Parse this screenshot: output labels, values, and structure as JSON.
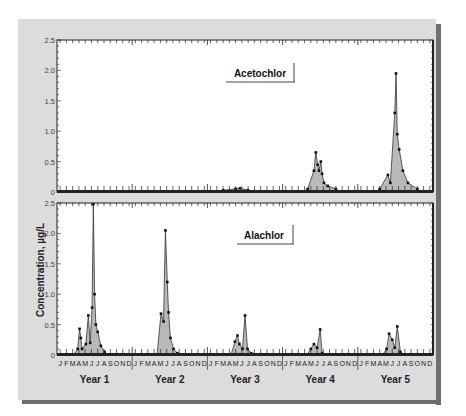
{
  "chart_data": [
    {
      "type": "area",
      "title": "Acetochlor",
      "xlabel": "",
      "ylabel": "Concentration, µg/L",
      "ylim": [
        0,
        2.5
      ],
      "yticks": [
        "0",
        "0.5",
        "1.0",
        "1.5",
        "2.0",
        "2.5"
      ],
      "x_categories": [
        "Year 1",
        "Year 2",
        "Year 3",
        "Year 4",
        "Year 5"
      ],
      "months": [
        "J",
        "F",
        "M",
        "A",
        "M",
        "J",
        "J",
        "A",
        "S",
        "O",
        "N",
        "D"
      ],
      "grid": false,
      "legend_position": "upper-center-right",
      "series": [
        {
          "name": "Acetochlor",
          "points": [
            {
              "year": 3,
              "month": 2.5,
              "value": 0.03
            },
            {
              "year": 3,
              "month": 4.5,
              "value": 0.05
            },
            {
              "year": 3,
              "month": 5.2,
              "value": 0.06
            },
            {
              "year": 3,
              "month": 6.5,
              "value": 0.03
            },
            {
              "year": 4,
              "month": 4.0,
              "value": 0.05
            },
            {
              "year": 4,
              "month": 5.0,
              "value": 0.35
            },
            {
              "year": 4,
              "month": 5.3,
              "value": 0.65
            },
            {
              "year": 4,
              "month": 5.6,
              "value": 0.45
            },
            {
              "year": 4,
              "month": 5.8,
              "value": 0.35
            },
            {
              "year": 4,
              "month": 6.1,
              "value": 0.5
            },
            {
              "year": 4,
              "month": 6.3,
              "value": 0.3
            },
            {
              "year": 4,
              "month": 6.6,
              "value": 0.15
            },
            {
              "year": 4,
              "month": 7.2,
              "value": 0.1
            },
            {
              "year": 4,
              "month": 8.5,
              "value": 0.05
            },
            {
              "year": 5,
              "month": 3.5,
              "value": 0.05
            },
            {
              "year": 5,
              "month": 4.8,
              "value": 0.28
            },
            {
              "year": 5,
              "month": 5.2,
              "value": 0.15
            },
            {
              "year": 5,
              "month": 5.9,
              "value": 1.3
            },
            {
              "year": 5,
              "month": 6.1,
              "value": 1.95
            },
            {
              "year": 5,
              "month": 6.3,
              "value": 0.95
            },
            {
              "year": 5,
              "month": 6.6,
              "value": 0.7
            },
            {
              "year": 5,
              "month": 7.2,
              "value": 0.35
            },
            {
              "year": 5,
              "month": 8.0,
              "value": 0.15
            },
            {
              "year": 5,
              "month": 9.5,
              "value": 0.05
            }
          ]
        }
      ]
    },
    {
      "type": "area",
      "title": "Alachlor",
      "xlabel": "",
      "ylabel": "Concentration, µg/L",
      "ylim": [
        0,
        2.5
      ],
      "yticks": [
        "0",
        "0.5",
        "1.0",
        "1.5",
        "2.0",
        "2.5"
      ],
      "x_categories": [
        "Year 1",
        "Year 2",
        "Year 3",
        "Year 4",
        "Year 5"
      ],
      "months": [
        "J",
        "F",
        "M",
        "A",
        "M",
        "J",
        "J",
        "A",
        "S",
        "O",
        "N",
        "D"
      ],
      "grid": false,
      "legend_position": "upper-center-right",
      "series": [
        {
          "name": "Alachlor",
          "points": [
            {
              "year": 1,
              "month": 3.3,
              "value": 0.1
            },
            {
              "year": 1,
              "month": 3.6,
              "value": 0.43
            },
            {
              "year": 1,
              "month": 3.8,
              "value": 0.28
            },
            {
              "year": 1,
              "month": 4.0,
              "value": 0.1
            },
            {
              "year": 1,
              "month": 4.6,
              "value": 0.18
            },
            {
              "year": 1,
              "month": 5.0,
              "value": 0.65
            },
            {
              "year": 1,
              "month": 5.3,
              "value": 0.2
            },
            {
              "year": 1,
              "month": 5.6,
              "value": 0.78
            },
            {
              "year": 1,
              "month": 5.8,
              "value": 2.48
            },
            {
              "year": 1,
              "month": 6.0,
              "value": 1.0
            },
            {
              "year": 1,
              "month": 6.2,
              "value": 0.5
            },
            {
              "year": 1,
              "month": 6.5,
              "value": 0.38
            },
            {
              "year": 1,
              "month": 7.0,
              "value": 0.15
            },
            {
              "year": 1,
              "month": 7.6,
              "value": 0.05
            },
            {
              "year": 2,
              "month": 4.6,
              "value": 0.68
            },
            {
              "year": 2,
              "month": 5.0,
              "value": 0.55
            },
            {
              "year": 2,
              "month": 5.3,
              "value": 2.05
            },
            {
              "year": 2,
              "month": 5.6,
              "value": 1.2
            },
            {
              "year": 2,
              "month": 5.8,
              "value": 0.7
            },
            {
              "year": 2,
              "month": 6.1,
              "value": 0.28
            },
            {
              "year": 2,
              "month": 6.6,
              "value": 0.1
            },
            {
              "year": 2,
              "month": 7.2,
              "value": 0.03
            },
            {
              "year": 3,
              "month": 4.4,
              "value": 0.22
            },
            {
              "year": 3,
              "month": 4.8,
              "value": 0.32
            },
            {
              "year": 3,
              "month": 5.1,
              "value": 0.18
            },
            {
              "year": 3,
              "month": 5.6,
              "value": 0.1
            },
            {
              "year": 3,
              "month": 6.0,
              "value": 0.65
            },
            {
              "year": 3,
              "month": 6.4,
              "value": 0.1
            },
            {
              "year": 3,
              "month": 7.0,
              "value": 0.03
            },
            {
              "year": 4,
              "month": 4.5,
              "value": 0.1
            },
            {
              "year": 4,
              "month": 5.0,
              "value": 0.18
            },
            {
              "year": 4,
              "month": 5.5,
              "value": 0.12
            },
            {
              "year": 4,
              "month": 6.0,
              "value": 0.42
            },
            {
              "year": 4,
              "month": 6.3,
              "value": 0.03
            },
            {
              "year": 5,
              "month": 4.6,
              "value": 0.1
            },
            {
              "year": 5,
              "month": 5.0,
              "value": 0.35
            },
            {
              "year": 5,
              "month": 5.5,
              "value": 0.25
            },
            {
              "year": 5,
              "month": 5.9,
              "value": 0.12
            },
            {
              "year": 5,
              "month": 6.3,
              "value": 0.47
            },
            {
              "year": 5,
              "month": 6.8,
              "value": 0.05
            }
          ]
        }
      ]
    }
  ],
  "panels": {
    "top": {
      "label": "Acetochlor"
    },
    "bottom": {
      "label": "Alachlor"
    }
  },
  "axis": {
    "ylabel": "Concentration, µg/L",
    "yticks": [
      "0",
      "0.5",
      "1.0",
      "1.5",
      "2.0",
      "2.5"
    ],
    "months": [
      "J",
      "F",
      "M",
      "A",
      "M",
      "J",
      "J",
      "A",
      "S",
      "O",
      "N",
      "D"
    ],
    "years": [
      "Year 1",
      "Year 2",
      "Year 3",
      "Year 4",
      "Year 5"
    ]
  },
  "colors": {
    "frame": "#dcdcdc",
    "fill": "#b9b9b9",
    "line": "#333333",
    "axis": "#222222"
  }
}
